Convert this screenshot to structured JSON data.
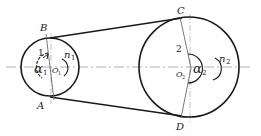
{
  "diagram": {
    "pulley_small": {
      "number": "1",
      "center_label": "O",
      "center_sub": "1",
      "angle_label": "α",
      "angle_sub": "1",
      "speed_label": "n",
      "speed_sub": "1",
      "tangent_top": "B",
      "tangent_bottom": "A"
    },
    "pulley_large": {
      "number": "2",
      "center_label": "O",
      "center_sub": "2",
      "angle_label": "α",
      "angle_sub": "2",
      "speed_label": "n",
      "speed_sub": "2",
      "tangent_top": "C",
      "tangent_bottom": "D"
    },
    "colors": {
      "stroke": "#1a1a1a",
      "centerline": "#888888"
    }
  }
}
